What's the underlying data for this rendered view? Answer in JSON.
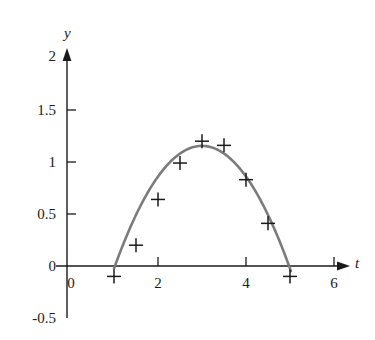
{
  "chart_data": {
    "type": "scatter",
    "title": "",
    "xlabel": "t",
    "ylabel": "y",
    "xlim": [
      -0.45,
      6.45
    ],
    "ylim": [
      -0.5,
      2.05
    ],
    "grid": false,
    "legend": null,
    "x_ticks": [
      {
        "value": 0,
        "label": "0"
      },
      {
        "value": 2,
        "label": "2"
      },
      {
        "value": 4,
        "label": "4"
      },
      {
        "value": 6,
        "label": "6"
      }
    ],
    "y_ticks": [
      {
        "value": -0.5,
        "label": "-0.5"
      },
      {
        "value": 0,
        "label": "0"
      },
      {
        "value": 0.5,
        "label": "0.5"
      },
      {
        "value": 1,
        "label": "1"
      },
      {
        "value": 1.5,
        "label": "1.5"
      },
      {
        "value": 2,
        "label": "2"
      }
    ],
    "series": [
      {
        "name": "data points",
        "type": "scatter",
        "marker": "plus",
        "color": "#1a1a1a",
        "points": [
          {
            "t": 1.0,
            "y": -0.1
          },
          {
            "t": 1.5,
            "y": 0.2
          },
          {
            "t": 2.0,
            "y": 0.64
          },
          {
            "t": 2.5,
            "y": 0.99
          },
          {
            "t": 3.0,
            "y": 1.2
          },
          {
            "t": 3.5,
            "y": 1.16
          },
          {
            "t": 4.0,
            "y": 0.83
          },
          {
            "t": 4.5,
            "y": 0.41
          },
          {
            "t": 5.0,
            "y": -0.1
          }
        ]
      },
      {
        "name": "fitted curve",
        "type": "line",
        "color": "#7b7b7b",
        "t_range": [
          1.0,
          5.02
        ],
        "curve": {
          "form": "quadratic",
          "a": -0.295,
          "b": 1.77,
          "c": -1.5,
          "vertex_t": 3.0,
          "vertex_y": 1.155,
          "roots": [
            1.18,
            4.82
          ]
        }
      }
    ]
  },
  "axes": {
    "x_axis_label": "t",
    "y_axis_label": "y",
    "x_arrow": true,
    "y_arrow": true
  }
}
